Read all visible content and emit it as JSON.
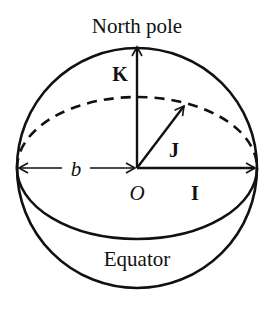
{
  "diagram": {
    "title_label": "North pole",
    "bottom_label": "Equator",
    "origin_label": "O",
    "radius_label": "b",
    "vectors": [
      {
        "name": "K",
        "label": "K",
        "direction": "up (toward north pole)"
      },
      {
        "name": "J",
        "label": "J",
        "direction": "diagonal into page"
      },
      {
        "name": "I",
        "label": "I",
        "direction": "right"
      }
    ],
    "colors": {
      "stroke": "#111111",
      "background": "#ffffff"
    }
  }
}
